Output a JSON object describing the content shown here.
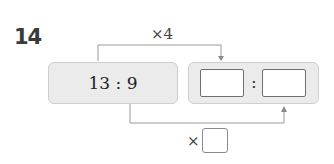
{
  "problem": {
    "number": "14",
    "given_ratio": "13 : 9",
    "top_operation": "×4",
    "bottom_operation_symbol": "×",
    "answer_separator": ":",
    "answer_blanks": [
      "",
      ""
    ],
    "multiplier_blank": ""
  },
  "colors": {
    "box_fill": "#ebebeb",
    "box_border": "#cfcfcf",
    "connector": "#9a9a9a",
    "number": "#3a3a3a"
  }
}
